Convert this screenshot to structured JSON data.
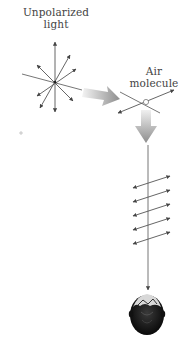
{
  "labels": {
    "unpolarized_line1": "Unpolarized",
    "unpolarized_line2": "light",
    "air_line1": "Air",
    "air_line2": "molecule"
  },
  "polarized_arrow_count": 5,
  "colors": {
    "line": "#555555",
    "arrowhead": "#444444",
    "big_arrow_light": "#e8e8e8",
    "big_arrow_dark": "#8a8a8a",
    "head": "#111111"
  }
}
